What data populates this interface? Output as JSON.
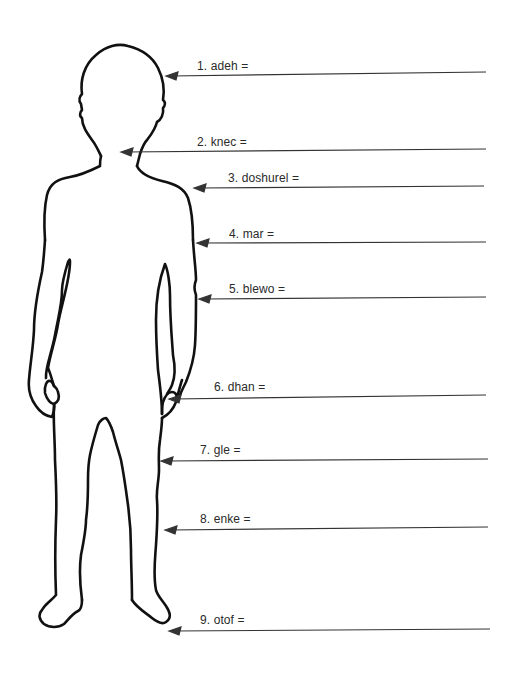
{
  "worksheet": {
    "figure": "child-body-outline",
    "line_color": "#111111",
    "arrow_color": "#333333",
    "labels": [
      {
        "number": "1.",
        "word": "adeh",
        "text": "1. adeh =",
        "label_x": 197,
        "label_y": 60,
        "line_y": 72,
        "arrow_x": 167,
        "line_end_x": 486
      },
      {
        "number": "2.",
        "word": "knec",
        "text": "2. knec =",
        "label_x": 197,
        "label_y": 136,
        "line_y": 149,
        "arrow_x": 122,
        "line_end_x": 486
      },
      {
        "number": "3.",
        "word": "doshurel",
        "text": "3. doshurel =",
        "label_x": 228,
        "label_y": 172,
        "line_y": 186,
        "arrow_x": 195,
        "line_end_x": 484
      },
      {
        "number": "4.",
        "word": "mar",
        "text": "4. mar =",
        "label_x": 229,
        "label_y": 228,
        "line_y": 242,
        "arrow_x": 198,
        "line_end_x": 486
      },
      {
        "number": "5.",
        "word": "blewo",
        "text": "5. blewo =",
        "label_x": 229,
        "label_y": 283,
        "line_y": 297,
        "arrow_x": 200,
        "line_end_x": 486
      },
      {
        "number": "6.",
        "word": "dhan",
        "text": "6. dhan =",
        "label_x": 214,
        "label_y": 381,
        "line_y": 396,
        "arrow_x": 170,
        "line_end_x": 486
      },
      {
        "number": "7.",
        "word": "gle",
        "text": "7. gle =",
        "label_x": 200,
        "label_y": 444,
        "line_y": 459,
        "arrow_x": 162,
        "line_end_x": 488
      },
      {
        "number": "8.",
        "word": "enke",
        "text": "8. enke =",
        "label_x": 200,
        "label_y": 513,
        "line_y": 528,
        "arrow_x": 166,
        "line_end_x": 488
      },
      {
        "number": "9.",
        "word": "otof",
        "text": "9. otof =",
        "label_x": 200,
        "label_y": 614,
        "line_y": 630,
        "arrow_x": 170,
        "line_end_x": 490
      }
    ]
  }
}
